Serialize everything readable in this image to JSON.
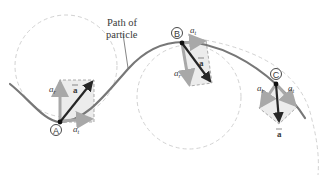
{
  "figure": {
    "path_label_line1": "Path of",
    "path_label_line2": "particle",
    "points": [
      {
        "id": "A",
        "label": "A",
        "radial_label": "a",
        "radial_sub": "r",
        "tangential_label": "a",
        "tangential_sub": "t",
        "total_label": "a"
      },
      {
        "id": "B",
        "label": "B",
        "radial_label": "a",
        "radial_sub": "r",
        "tangential_label": "a",
        "tangential_sub": "t",
        "total_label": "a"
      },
      {
        "id": "C",
        "label": "C",
        "radial_label": "a",
        "radial_sub": "r",
        "tangential_label": "a",
        "tangential_sub": "t",
        "total_label": "a"
      }
    ],
    "colors": {
      "path": "#777777",
      "component_arrow": "#a8a8a8",
      "total_arrow": "#262626",
      "dashed_circle": "#cfcfcf",
      "rect_fill": "#ececec",
      "rect_stroke": "#8a8a8a"
    }
  }
}
